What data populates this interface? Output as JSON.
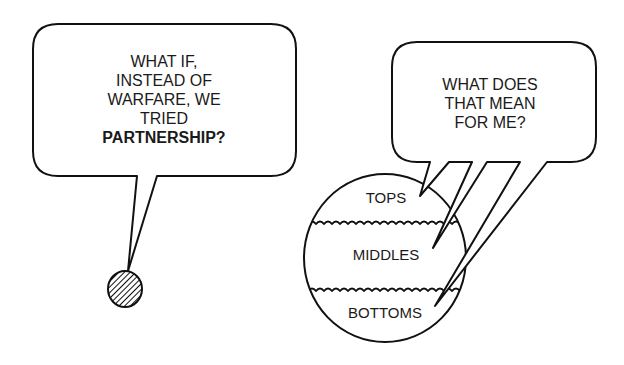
{
  "left_bubble": {
    "lines": [
      "WHAT IF,",
      "INSTEAD OF",
      "WARFARE, WE",
      "TRIED",
      "PARTNERSHIP?"
    ],
    "bold_line_index": 4
  },
  "right_bubble": {
    "lines": [
      "WHAT DOES",
      "THAT MEAN",
      "FOR ME?"
    ]
  },
  "speaker": {
    "icon": "hatched-circle-icon"
  },
  "layers": {
    "top": "TOPS",
    "middle": "MIDDLES",
    "bottom": "BOTTOMS"
  },
  "colors": {
    "ink": "#111111",
    "background": "#ffffff"
  }
}
